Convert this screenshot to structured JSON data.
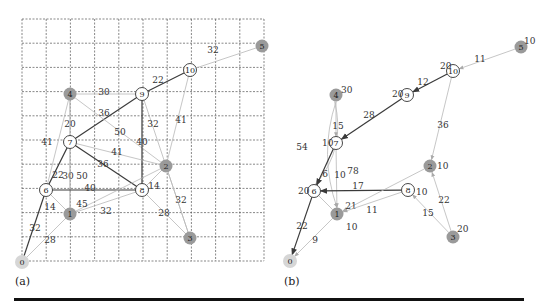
{
  "captions": {
    "a": "(a)",
    "b": "(b)"
  },
  "panel_a": {
    "grid": {
      "x0": 22,
      "y0": 19,
      "cell": 24.2,
      "cols": 10,
      "rows": 10
    },
    "nodes": [
      {
        "id": "0",
        "x": 22,
        "y": 262,
        "style": "light"
      },
      {
        "id": "1",
        "x": 70,
        "y": 214,
        "style": "gray"
      },
      {
        "id": "2",
        "x": 166,
        "y": 166,
        "style": "gray"
      },
      {
        "id": "3",
        "x": 190,
        "y": 238,
        "style": "gray"
      },
      {
        "id": "4",
        "x": 70,
        "y": 94,
        "style": "gray"
      },
      {
        "id": "5",
        "x": 262,
        "y": 46,
        "style": "gray"
      },
      {
        "id": "6",
        "x": 46,
        "y": 190,
        "style": "open"
      },
      {
        "id": "7",
        "x": 70,
        "y": 142,
        "style": "open"
      },
      {
        "id": "8",
        "x": 142,
        "y": 190,
        "style": "open"
      },
      {
        "id": "9",
        "x": 142,
        "y": 94,
        "style": "open"
      },
      {
        "id": "10",
        "x": 190,
        "y": 70,
        "style": "open"
      }
    ],
    "edges": [
      {
        "from": "5",
        "to": "10",
        "w": "32",
        "dark": false,
        "lx": 213,
        "ly": 50
      },
      {
        "from": "10",
        "to": "9",
        "w": "22",
        "dark": true,
        "lx": 158,
        "ly": 80
      },
      {
        "from": "4",
        "to": "9",
        "w": "30",
        "dark": false,
        "lx": 104,
        "ly": 92
      },
      {
        "from": "9",
        "to": "7",
        "w": "36",
        "dark": true,
        "lx": 104,
        "ly": 113
      },
      {
        "from": "4",
        "to": "2",
        "w": "50",
        "dark": false,
        "lx": 120,
        "ly": 132
      },
      {
        "from": "9",
        "to": "8",
        "w": "40",
        "dark": true,
        "lx": 142,
        "ly": 142
      },
      {
        "from": "9",
        "to": "3",
        "w": "32",
        "dark": false,
        "lx": 153,
        "ly": 124
      },
      {
        "from": "10",
        "to": "2",
        "w": "41",
        "dark": false,
        "lx": 181,
        "ly": 120
      },
      {
        "from": "4",
        "to": "7",
        "w": "20",
        "dark": false,
        "lx": 70,
        "ly": 124
      },
      {
        "from": "4",
        "to": "6",
        "w": "41",
        "dark": false,
        "lx": 47,
        "ly": 142
      },
      {
        "from": "7",
        "to": "2",
        "w": "41",
        "dark": false,
        "lx": 117,
        "ly": 152
      },
      {
        "from": "7",
        "to": "8",
        "w": "36",
        "dark": true,
        "lx": 103,
        "ly": 164
      },
      {
        "from": "7",
        "to": "6",
        "w": "22",
        "dark": true,
        "lx": 58,
        "ly": 175
      },
      {
        "from": "7",
        "to": "1",
        "w": "30",
        "dark": false,
        "lx": 68,
        "ly": 176
      },
      {
        "from": "4",
        "to": "1",
        "w": "50",
        "dark": false,
        "lx": 82,
        "ly": 176
      },
      {
        "from": "6",
        "to": "8",
        "w": "40",
        "dark": true,
        "lx": 90,
        "ly": 188
      },
      {
        "from": "1",
        "to": "2",
        "w": "45",
        "dark": false,
        "lx": 82,
        "ly": 204
      },
      {
        "from": "1",
        "to": "8",
        "w": "32",
        "dark": false,
        "lx": 106,
        "ly": 211
      },
      {
        "from": "8",
        "to": "2",
        "w": "14",
        "dark": false,
        "lx": 154,
        "ly": 186
      },
      {
        "from": "2",
        "to": "3",
        "w": "32",
        "dark": false,
        "lx": 181,
        "ly": 200
      },
      {
        "from": "8",
        "to": "3",
        "w": "28",
        "dark": false,
        "lx": 164,
        "ly": 213
      },
      {
        "from": "6",
        "to": "1",
        "w": "14",
        "dark": false,
        "lx": 50,
        "ly": 207
      },
      {
        "from": "6",
        "to": "0",
        "w": "32",
        "dark": true,
        "lx": 35,
        "ly": 228
      },
      {
        "from": "0",
        "to": "1",
        "w": "28",
        "dark": false,
        "lx": 50,
        "ly": 240
      }
    ]
  },
  "panel_b": {
    "nodes": [
      {
        "id": "0",
        "x": 290,
        "y": 261,
        "style": "light",
        "val": ""
      },
      {
        "id": "1",
        "x": 337,
        "y": 214,
        "style": "gray",
        "val": "10",
        "vx": 346,
        "vy": 227
      },
      {
        "id": "2",
        "x": 430,
        "y": 166,
        "style": "gray",
        "val": "10",
        "vx": 437,
        "vy": 166
      },
      {
        "id": "3",
        "x": 453,
        "y": 237,
        "style": "gray",
        "val": "20",
        "vx": 457,
        "vy": 229
      },
      {
        "id": "4",
        "x": 336,
        "y": 95,
        "style": "gray",
        "val": "30",
        "vx": 341,
        "vy": 90
      },
      {
        "id": "5",
        "x": 521,
        "y": 47,
        "style": "gray",
        "val": "10",
        "vx": 524,
        "vy": 41
      },
      {
        "id": "6",
        "x": 314,
        "y": 191,
        "style": "open",
        "val": "20",
        "vx": 298,
        "vy": 191
      },
      {
        "id": "7",
        "x": 336,
        "y": 143,
        "style": "open",
        "val": "10",
        "vx": 322,
        "vy": 143
      },
      {
        "id": "8",
        "x": 408,
        "y": 190,
        "style": "open",
        "val": "10",
        "vx": 416,
        "vy": 192
      },
      {
        "id": "9",
        "x": 407,
        "y": 95,
        "style": "open",
        "val": "20",
        "vx": 392,
        "vy": 94
      },
      {
        "id": "10",
        "x": 453,
        "y": 71,
        "style": "open",
        "val": "20",
        "vx": 440,
        "vy": 66
      }
    ],
    "edges": [
      {
        "from": "5",
        "to": "10",
        "w": "11",
        "dark": false,
        "lx": 480,
        "ly": 59,
        "curve": 0
      },
      {
        "from": "10",
        "to": "9",
        "w": "12",
        "dark": true,
        "lx": 423,
        "ly": 82,
        "curve": 0
      },
      {
        "from": "9",
        "to": "7",
        "w": "28",
        "dark": true,
        "lx": 369,
        "ly": 115,
        "curve": 0
      },
      {
        "from": "10",
        "to": "2",
        "w": "36",
        "dark": false,
        "lx": 443,
        "ly": 125,
        "curve": 0
      },
      {
        "from": "4",
        "to": "7",
        "w": "15",
        "dark": false,
        "lx": 338,
        "ly": 126,
        "curve": 0
      },
      {
        "from": "4",
        "to": "6",
        "w": "54",
        "dark": false,
        "lx": 302,
        "ly": 147,
        "curve": -22
      },
      {
        "from": "4",
        "to": "1",
        "w": "78",
        "dark": false,
        "lx": 353,
        "ly": 171,
        "curve": 18
      },
      {
        "from": "7",
        "to": "6",
        "w": "6",
        "dark": true,
        "lx": 325,
        "ly": 174,
        "curve": 0
      },
      {
        "from": "7",
        "to": "1",
        "w": "10",
        "dark": false,
        "lx": 340,
        "ly": 175,
        "curve": 0
      },
      {
        "from": "8",
        "to": "6",
        "w": "17",
        "dark": true,
        "lx": 358,
        "ly": 186,
        "curve": 0
      },
      {
        "from": "2",
        "to": "1",
        "w": "21",
        "dark": false,
        "lx": 351,
        "ly": 206,
        "curve": 0
      },
      {
        "from": "8",
        "to": "1",
        "w": "11",
        "dark": false,
        "lx": 372,
        "ly": 210,
        "curve": 0
      },
      {
        "from": "3",
        "to": "2",
        "w": "22",
        "dark": false,
        "lx": 444,
        "ly": 200,
        "curve": 0
      },
      {
        "from": "3",
        "to": "8",
        "w": "15",
        "dark": false,
        "lx": 428,
        "ly": 213,
        "curve": 0
      },
      {
        "from": "6",
        "to": "1",
        "w": "",
        "dark": false,
        "lx": 0,
        "ly": 0,
        "curve": 0,
        "noarrow": true
      },
      {
        "from": "6",
        "to": "0",
        "w": "22",
        "dark": true,
        "lx": 302,
        "ly": 226,
        "curve": 0
      },
      {
        "from": "1",
        "to": "0",
        "w": "9",
        "dark": false,
        "lx": 315,
        "ly": 240,
        "curve": 0
      }
    ]
  },
  "colors": {
    "dark_edge": "#3a3a3a",
    "light_edge": "#b8b8b8",
    "gray_node": "#9a9a9a",
    "light_node": "#d6d6d6",
    "grid": "#555555"
  }
}
